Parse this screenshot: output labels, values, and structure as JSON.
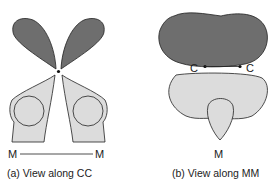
{
  "panel_a": {
    "caption": "(a) View along CC",
    "label_left": "M",
    "label_right": "M"
  },
  "panel_b": {
    "caption": "(b) View along MM",
    "label_c_left": "C",
    "label_c_right": "C",
    "label_m": "M"
  },
  "colors": {
    "dark_lobe": "#6e6e6e",
    "light_lobe": "#dcdcdc",
    "outline": "#222222"
  }
}
